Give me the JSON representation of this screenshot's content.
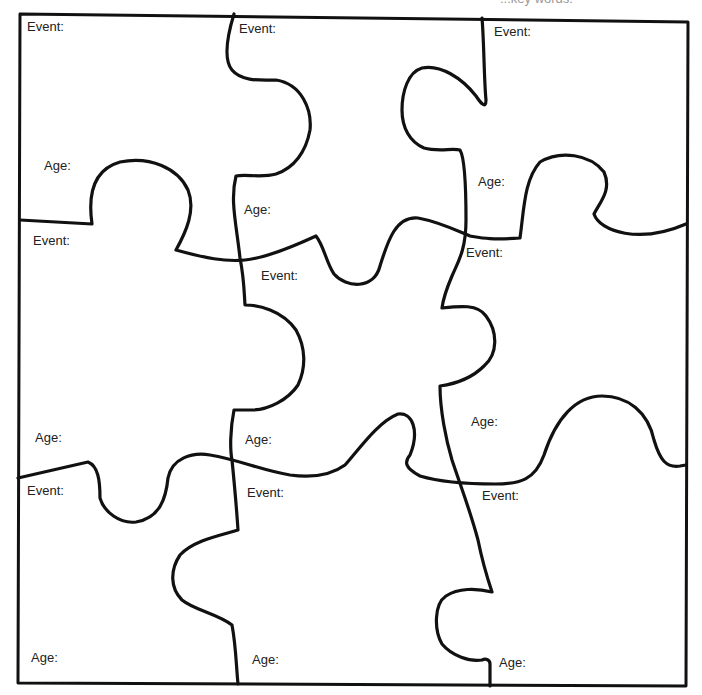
{
  "worksheet": {
    "top_caption": "...key words.",
    "puzzle": {
      "rows": 3,
      "cols": 3,
      "stroke_color": "#111111",
      "background": "#ffffff",
      "pieces": [
        {
          "row": 1,
          "col": 1,
          "event_label": "Event:",
          "age_label": "Age:"
        },
        {
          "row": 1,
          "col": 2,
          "event_label": "Event:",
          "age_label": "Age:"
        },
        {
          "row": 1,
          "col": 3,
          "event_label": "Event:",
          "age_label": "Age:"
        },
        {
          "row": 2,
          "col": 1,
          "event_label": "Event:",
          "age_label": "Age:"
        },
        {
          "row": 2,
          "col": 2,
          "event_label": "Event:",
          "age_label": "Age:"
        },
        {
          "row": 2,
          "col": 3,
          "event_label": "Event:",
          "age_label": "Age:"
        },
        {
          "row": 3,
          "col": 1,
          "event_label": "Event:",
          "age_label": "Age:"
        },
        {
          "row": 3,
          "col": 2,
          "event_label": "Event:",
          "age_label": "Age:"
        },
        {
          "row": 3,
          "col": 3,
          "event_label": "Event:",
          "age_label": "Age:"
        }
      ]
    }
  }
}
